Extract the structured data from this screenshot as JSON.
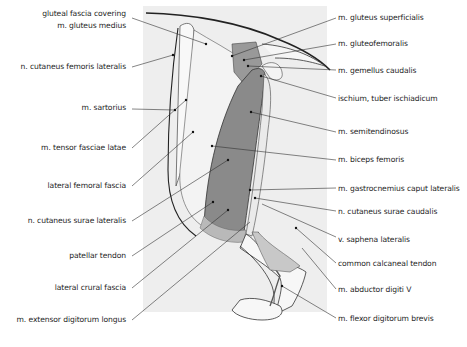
{
  "figure": {
    "colors": {
      "panel": "#eeeeee",
      "muscle": "#8a8a8a",
      "muscle_light": "#b9b9b9",
      "leader": "#333333"
    }
  },
  "labels_left": [
    {
      "id": "gluteal-fascia",
      "lines": [
        "gluteal fascia covering",
        "m. gluteus medius"
      ]
    },
    {
      "id": "n-cutaneus-femoris-lateralis",
      "lines": [
        "n. cutaneus femoris lateralis"
      ]
    },
    {
      "id": "m-sartorius",
      "lines": [
        "m. sartorius"
      ]
    },
    {
      "id": "m-tensor-fasciae-latae",
      "lines": [
        "m. tensor fasciae latae"
      ]
    },
    {
      "id": "lateral-femoral-fascia",
      "lines": [
        "lateral femoral fascia"
      ]
    },
    {
      "id": "n-cutaneus-surae-lateralis",
      "lines": [
        "n. cutaneus surae lateralis"
      ]
    },
    {
      "id": "patellar-tendon",
      "lines": [
        "patellar tendon"
      ]
    },
    {
      "id": "lateral-crural-fascia",
      "lines": [
        "lateral crural fascia"
      ]
    },
    {
      "id": "m-extensor-digitorum-longus",
      "lines": [
        "m. extensor digitorum longus"
      ]
    }
  ],
  "labels_right": [
    {
      "id": "m-gluteus-superficialis",
      "lines": [
        "m. gluteus superficialis"
      ]
    },
    {
      "id": "m-gluteofemoralis",
      "lines": [
        "m. gluteofemoralis"
      ]
    },
    {
      "id": "m-gemellus-caudalis",
      "lines": [
        "m. gemellus caudalis"
      ]
    },
    {
      "id": "ischium-tuber",
      "lines": [
        "ischium, tuber ischiadicum"
      ]
    },
    {
      "id": "m-semitendinosus",
      "lines": [
        "m. semitendinosus"
      ]
    },
    {
      "id": "m-biceps-femoris",
      "lines": [
        "m. biceps femoris"
      ]
    },
    {
      "id": "m-gastrocnemius",
      "lines": [
        "m. gastrocnemius caput lateralis"
      ]
    },
    {
      "id": "n-cutaneus-surae-caudalis",
      "lines": [
        "n. cutaneus surae caudalis"
      ]
    },
    {
      "id": "v-saphena-lateralis",
      "lines": [
        "v. saphena lateralis"
      ]
    },
    {
      "id": "common-calcaneal-tendon",
      "lines": [
        "common calcaneal tendon"
      ]
    },
    {
      "id": "m-abductor-digiti-v",
      "lines": [
        "m. abductor digiti V"
      ]
    },
    {
      "id": "m-flexor-digitorum-brevis",
      "lines": [
        "m. flexor digitorum brevis"
      ]
    }
  ]
}
